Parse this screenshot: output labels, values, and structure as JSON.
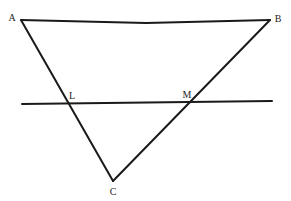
{
  "figure": {
    "kind": "geometry-diagram",
    "canvas": {
      "width": 291,
      "height": 201
    },
    "background_color": "#ffffff",
    "stroke_color": "#1a1a1a",
    "label_color": "#242424",
    "stroke_width": 2,
    "points": {
      "A": {
        "label": "A",
        "x": 21,
        "y": 20,
        "label_x": 12,
        "label_y": 18
      },
      "B": {
        "label": "B",
        "x": 270,
        "y": 20,
        "label_x": 278,
        "label_y": 19
      },
      "C": {
        "label": "C",
        "x": 113,
        "y": 181,
        "label_x": 113,
        "label_y": 192
      },
      "L": {
        "label": "L",
        "x": 68,
        "y": 103,
        "label_x": 72,
        "label_y": 96
      },
      "M": {
        "label": "M",
        "x": 190,
        "y": 102,
        "label_x": 187,
        "label_y": 95
      }
    },
    "segments": {
      "AB": {
        "name": "side-ab",
        "path": "M 21 20 L 146 23 L 270 20"
      },
      "AC": {
        "name": "side-ac",
        "path": "M 21 20 L 113 181"
      },
      "BC": {
        "name": "side-bc",
        "path": "M 270 20 L 113 181"
      },
      "transversal": {
        "name": "transversal-line",
        "path": "M 22 104 L 272 101"
      }
    }
  }
}
